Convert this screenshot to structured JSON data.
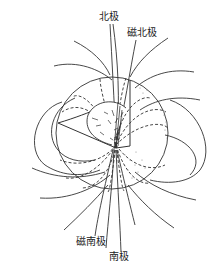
{
  "figure": {
    "labels": {
      "geographic_north": "北极",
      "magnetic_north": "磁北极",
      "magnetic_south": "磁南极",
      "geographic_south": "南极"
    },
    "colors": {
      "line": "#333333",
      "background": "#ffffff",
      "stipple": "#777777"
    }
  }
}
